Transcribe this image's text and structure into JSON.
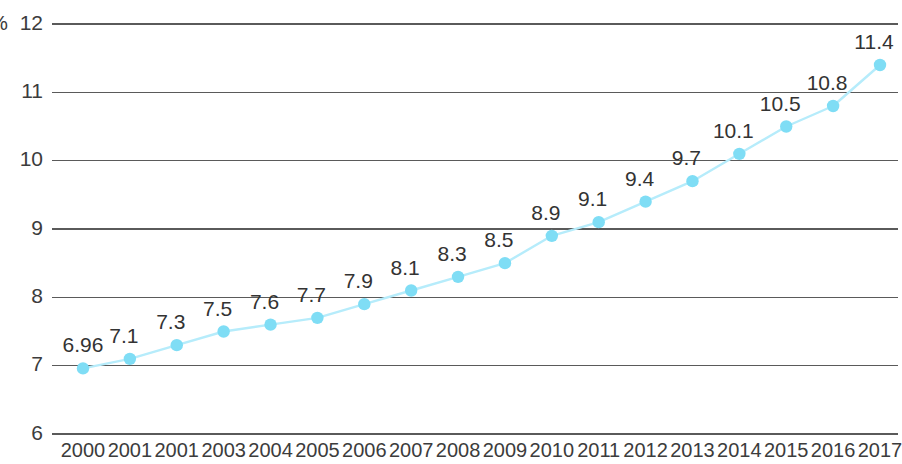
{
  "chart_data": {
    "type": "line",
    "title": "",
    "subtitle": "",
    "xlabel": "",
    "ylabel": "%",
    "unit_label": "%",
    "categories": [
      "2000",
      "2001",
      "2001",
      "2003",
      "2004",
      "2005",
      "2006",
      "2007",
      "2008",
      "2009",
      "2010",
      "2011",
      "2012",
      "2013",
      "2014",
      "2015",
      "2016",
      "2017"
    ],
    "values": [
      6.96,
      7.1,
      7.3,
      7.5,
      7.6,
      7.7,
      7.9,
      8.1,
      8.3,
      8.5,
      8.9,
      9.1,
      9.4,
      9.7,
      10.1,
      10.5,
      10.8,
      11.4
    ],
    "point_labels": [
      "6.96",
      "7.1",
      "7.3",
      "7.5",
      "7.6",
      "7.7",
      "7.9",
      "8.1",
      "8.3",
      "8.5",
      "8.9",
      "9.1",
      "9.4",
      "9.7",
      "10.1",
      "10.5",
      "10.8",
      "11.4"
    ],
    "ylim": [
      6,
      12
    ],
    "yticks": [
      6,
      7,
      8,
      9,
      10,
      11,
      12
    ],
    "ytick_labels": [
      "6",
      "7",
      "8",
      "9",
      "10",
      "11",
      "12"
    ],
    "grid": true,
    "grid_axis": "y",
    "legend": false,
    "legend_position": "none",
    "series": [
      {
        "name": "",
        "values": [
          6.96,
          7.1,
          7.3,
          7.5,
          7.6,
          7.7,
          7.9,
          8.1,
          8.3,
          8.5,
          8.9,
          9.1,
          9.4,
          9.7,
          10.1,
          10.5,
          10.8,
          11.4
        ]
      }
    ],
    "colors": {
      "line": "#b6ecfb",
      "marker": "#7fddf5",
      "gridline": "#5a5a5a",
      "text": "#3c3c3c",
      "background": "#ffffff"
    }
  }
}
